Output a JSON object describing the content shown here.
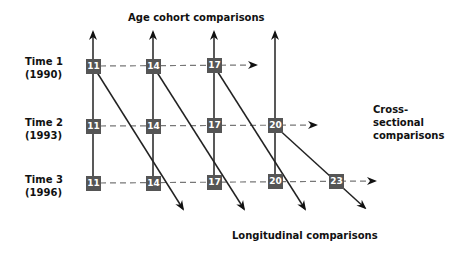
{
  "title": "Age cohort comparisons",
  "cross_label": "Cross-sectional comparisons",
  "cross_label_lines": [
    "Cross-",
    "sectional",
    "comparisons"
  ],
  "long_label": "Longitudinal comparisons",
  "rows": [
    {
      "label": "Time 1",
      "year": "(1990)",
      "ages": [
        "11",
        "14",
        "17"
      ]
    },
    {
      "label": "Time 2",
      "year": "(1993)",
      "ages": [
        "11",
        "14",
        "17",
        "20"
      ]
    },
    {
      "label": "Time 3",
      "year": "(1996)",
      "ages": [
        "11",
        "14",
        "17",
        "20",
        "23"
      ]
    }
  ],
  "colors": {
    "box": "#555555",
    "line": "#111111",
    "dash": "#777777"
  }
}
